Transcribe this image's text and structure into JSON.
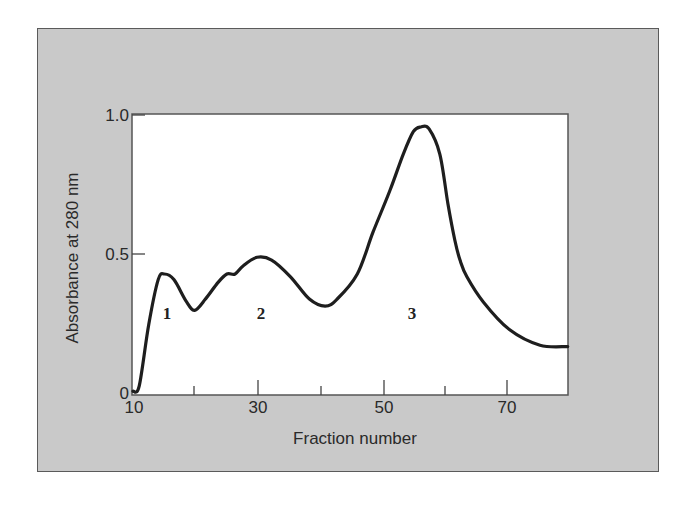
{
  "chart_data": {
    "type": "line",
    "title": "",
    "xlabel": "Fraction number",
    "ylabel": "Absorbance at 280 nm",
    "xlim": [
      10,
      79
    ],
    "ylim": [
      0,
      1.0
    ],
    "x_ticks": [
      10,
      20,
      30,
      40,
      50,
      60,
      70
    ],
    "x_tick_labels": [
      "10",
      "",
      "30",
      "",
      "50",
      "",
      "70"
    ],
    "y_ticks": [
      0,
      0.5,
      1.0
    ],
    "y_tick_labels": [
      "0",
      "0.5",
      "1.0"
    ],
    "grid": false,
    "legend": null,
    "series": [
      {
        "name": "A280",
        "x": [
          10,
          11,
          12.5,
          14,
          15,
          16.5,
          18.5,
          19.8,
          21.5,
          23.5,
          24.9,
          26.2,
          27.5,
          29.7,
          32,
          35,
          38,
          40.5,
          42.4,
          45.6,
          48.1,
          50.8,
          52.9,
          54.5,
          55.7,
          57,
          58.7,
          60,
          61.1,
          61.9,
          63,
          65.6,
          69.8,
          74.6,
          79
        ],
        "values": [
          0.01,
          0.03,
          0.25,
          0.41,
          0.43,
          0.41,
          0.33,
          0.3,
          0.34,
          0.4,
          0.43,
          0.43,
          0.46,
          0.49,
          0.48,
          0.42,
          0.34,
          0.315,
          0.34,
          0.43,
          0.58,
          0.73,
          0.86,
          0.94,
          0.957,
          0.95,
          0.86,
          0.68,
          0.55,
          0.48,
          0.42,
          0.33,
          0.23,
          0.175,
          0.17
        ]
      }
    ],
    "annotations": [
      {
        "text": "1",
        "x": 15.4,
        "y": 0.29
      },
      {
        "text": "2",
        "x": 30.1,
        "y": 0.29
      },
      {
        "text": "3",
        "x": 55.0,
        "y": 0.29
      }
    ]
  },
  "labels": {
    "xlabel": "Fraction number",
    "ylabel": "Absorbance at 280 nm",
    "yticks": [
      "1.0",
      "0.5",
      "0"
    ],
    "xticks": [
      "10",
      "30",
      "50",
      "70"
    ],
    "peaks": [
      "1",
      "2",
      "3"
    ]
  },
  "colors": {
    "frame_background": "#c9c9c9",
    "frame_border": "#5a5a5a",
    "plot_background": "#ffffff",
    "curve": "#1e1e1e"
  }
}
